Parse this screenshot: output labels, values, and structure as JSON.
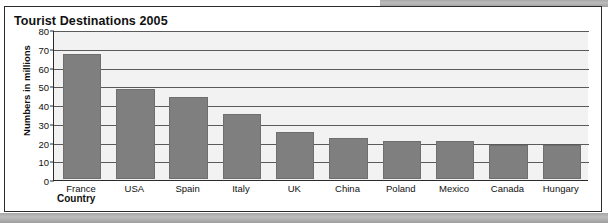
{
  "figure": {
    "title": "Tourist Destinations 2005",
    "x_axis_title": "Country",
    "y_axis_title": "Numbers in millions"
  },
  "colors": {
    "bar": "#7f7f7f",
    "plot_background": "#f2f2f2",
    "gridline": "#5a5a5a",
    "axis": "#2b2b2b",
    "text": "#111111"
  },
  "chart_data": {
    "type": "bar",
    "title": "Tourist Destinations 2005",
    "xlabel": "Country",
    "ylabel": "Numbers in millions",
    "categories": [
      "France",
      "USA",
      "Spain",
      "Italy",
      "UK",
      "China",
      "Poland",
      "Mexico",
      "Canada",
      "Hungary"
    ],
    "values": [
      67,
      48,
      44,
      35,
      25,
      22,
      20,
      20,
      18,
      18
    ],
    "ylim": [
      0,
      80
    ],
    "yticks": [
      0,
      10,
      20,
      30,
      40,
      50,
      60,
      70,
      80
    ],
    "ytick_labels": [
      "0",
      "10",
      "20",
      "30",
      "40",
      "50",
      "60",
      "70",
      "80"
    ],
    "grid": true,
    "legend": false
  }
}
